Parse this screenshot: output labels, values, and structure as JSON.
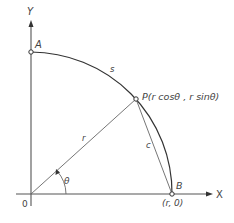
{
  "figure": {
    "axes": {
      "x_label": "X",
      "y_label": "Y",
      "origin_label": "0"
    },
    "points": {
      "A": {
        "label": "A"
      },
      "P": {
        "label": "P(r cosθ , r sinθ)"
      },
      "B": {
        "label": "B",
        "coord_label": "(r, 0)"
      }
    },
    "segments": {
      "radius_label": "r",
      "chord_label": "c",
      "arc_label": "s"
    },
    "angle": {
      "label": "θ"
    },
    "colors": {
      "line": "#333333",
      "axis": "#555555",
      "text": "#444444",
      "background": "#ffffff"
    }
  }
}
